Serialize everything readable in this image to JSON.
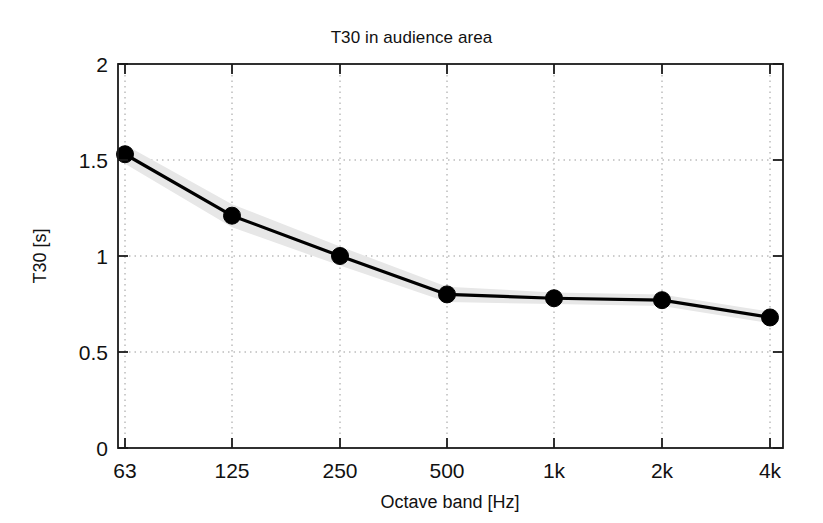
{
  "chart_data": {
    "type": "line",
    "title": "T30 in audience area",
    "xlabel": "Octave band [Hz]",
    "ylabel": "T30 [s]",
    "categories": [
      "63",
      "125",
      "250",
      "500",
      "1k",
      "2k",
      "4k"
    ],
    "values": [
      1.53,
      1.21,
      1.0,
      0.8,
      0.78,
      0.77,
      0.68
    ],
    "series": [
      {
        "name": "T30",
        "values": [
          1.53,
          1.21,
          1.0,
          0.8,
          0.78,
          0.77,
          0.68
        ]
      }
    ],
    "band_upper": [
      1.58,
      1.27,
      1.05,
      0.84,
      0.81,
      0.8,
      0.71
    ],
    "band_lower": [
      1.48,
      1.15,
      0.95,
      0.76,
      0.75,
      0.74,
      0.65
    ],
    "band_label": "spatial standard deviation",
    "band_color": "#e7e7e7",
    "line_color": "#000000",
    "marker_color": "#000000",
    "marker_style": "circle",
    "ylim": [
      0,
      2
    ],
    "yticks": [
      "0",
      "0.5",
      "1",
      "1.5",
      "2"
    ],
    "ytick_values": [
      0,
      0.5,
      1,
      1.5,
      2
    ],
    "xticks": [
      "63",
      "125",
      "250",
      "500",
      "1k",
      "2k",
      "4k"
    ],
    "grid": "dotted",
    "grid_color": "#9a9a9a",
    "legend": "none",
    "axis_color": "#1a1a1a",
    "background": "#ffffff"
  }
}
